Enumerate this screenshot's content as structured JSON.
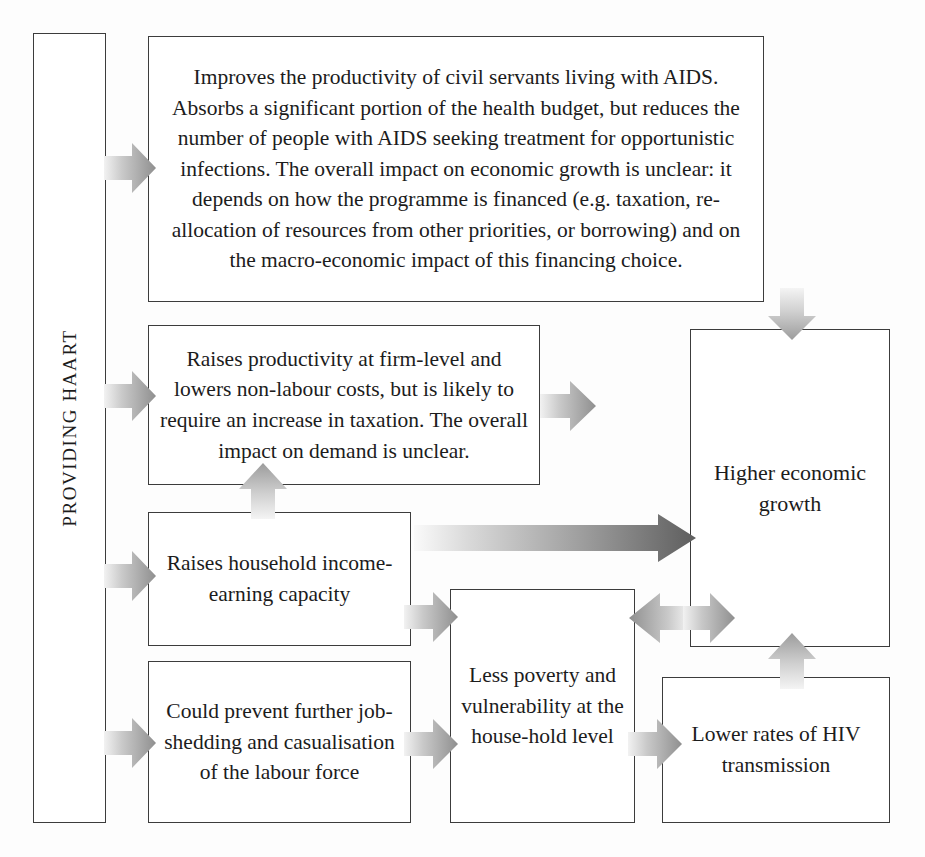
{
  "diagram": {
    "title": "Providing HAART",
    "spine": {
      "label": "PROVIDING HAART",
      "name": "providing-haart-spine"
    },
    "colors": {
      "box_border": "#3c3c3c",
      "box_fill": "#ffffff",
      "arrow_light": "#dcdcdc",
      "arrow_mid": "#9a9a9a",
      "arrow_dark": "#6e6e6e",
      "text": "#1c1c1c",
      "page_background": "#fdfdfd"
    },
    "boxes": [
      {
        "id": "civil-servants",
        "text": "Improves the productivity of civil servants living with AIDS. Absorbs a significant portion of the health budget, but reduces the number of people with AIDS seeking treatment for opportunistic infections. The overall impact on economic growth is unclear: it depends on how the programme is financed (e.g. taxation, re-allocation of resources from other priorities, or borrowing) and on the macro-economic impact of this financing choice."
      },
      {
        "id": "firm-level",
        "text": "Raises productivity at firm-level and lowers non-labour costs, but is likely to require an increase in taxation. The overall impact on demand is unclear."
      },
      {
        "id": "household",
        "text": "Raises household income-earning capacity"
      },
      {
        "id": "job-shedding",
        "text": "Could prevent further job-shedding and casualisation of the labour force"
      },
      {
        "id": "less-poverty",
        "text": "Less poverty and vulnerability at the house-hold level"
      },
      {
        "id": "hiv",
        "text": "Lower rates of HIV transmission"
      },
      {
        "id": "growth",
        "text": "Higher economic growth"
      }
    ],
    "arrows": [
      {
        "id": "haart-to-civil-servants",
        "direction": "right",
        "from": "providing-haart",
        "to": "civil-servants",
        "shade": "light-to-mid"
      },
      {
        "id": "haart-to-firm-level",
        "direction": "right",
        "from": "providing-haart",
        "to": "firm-level",
        "shade": "light-to-mid"
      },
      {
        "id": "haart-to-household",
        "direction": "right",
        "from": "providing-haart",
        "to": "household",
        "shade": "light-to-mid"
      },
      {
        "id": "haart-to-job-shedding",
        "direction": "right",
        "from": "providing-haart",
        "to": "job-shedding",
        "shade": "light-to-mid"
      },
      {
        "id": "civil-servants-to-growth",
        "direction": "down",
        "from": "civil-servants",
        "to": "growth",
        "shade": "light-to-mid"
      },
      {
        "id": "firm-level-to-growth",
        "direction": "right",
        "from": "firm-level",
        "to": "growth",
        "shade": "light-to-mid"
      },
      {
        "id": "household-to-firm-level",
        "direction": "up",
        "from": "household",
        "to": "firm-level",
        "shade": "light-to-mid"
      },
      {
        "id": "household-to-growth",
        "direction": "right",
        "from": "household",
        "to": "growth",
        "shade": "light-to-dark"
      },
      {
        "id": "household-to-less-poverty",
        "direction": "right",
        "from": "household",
        "to": "less-poverty",
        "shade": "light-to-mid"
      },
      {
        "id": "job-shedding-to-less-poverty",
        "direction": "right",
        "from": "job-shedding",
        "to": "less-poverty",
        "shade": "light-to-mid"
      },
      {
        "id": "less-poverty-to-hiv",
        "direction": "right",
        "from": "less-poverty",
        "to": "hiv",
        "shade": "light-to-mid"
      },
      {
        "id": "growth-to-less-poverty",
        "direction": "left",
        "from": "growth",
        "to": "less-poverty",
        "shade": "light-to-mid"
      },
      {
        "id": "hiv-to-growth",
        "direction": "up",
        "from": "hiv",
        "to": "growth",
        "shade": "light-to-mid"
      }
    ]
  }
}
